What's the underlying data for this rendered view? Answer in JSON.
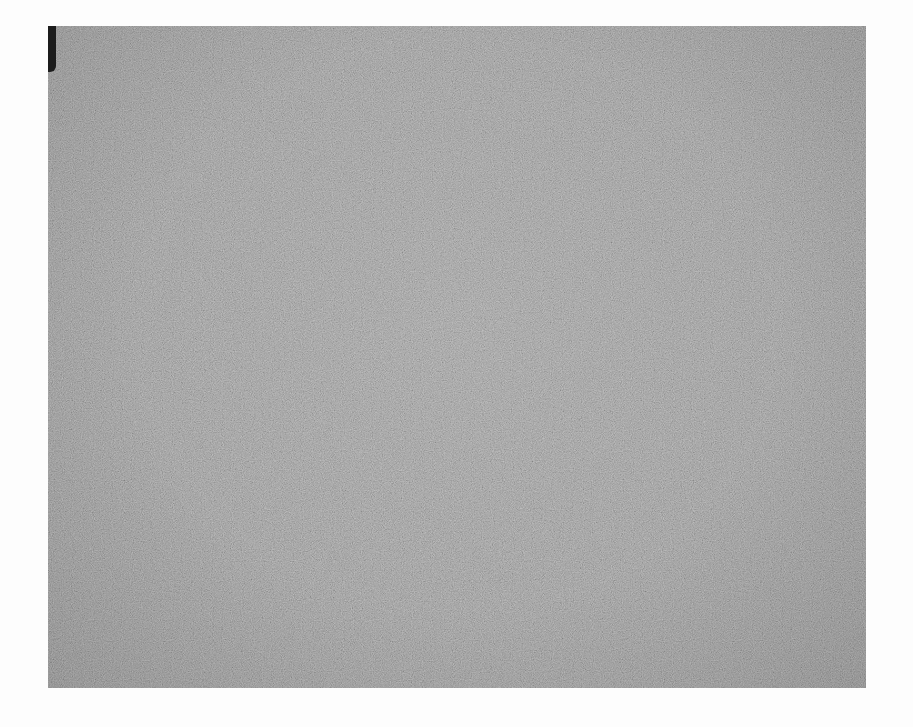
{
  "image": {
    "description": "Grainy mid-gray textured photograph",
    "base_color": "#8a8a8a",
    "edge_bar_color": "#1c1c1c",
    "background_color": "#ffffff"
  }
}
